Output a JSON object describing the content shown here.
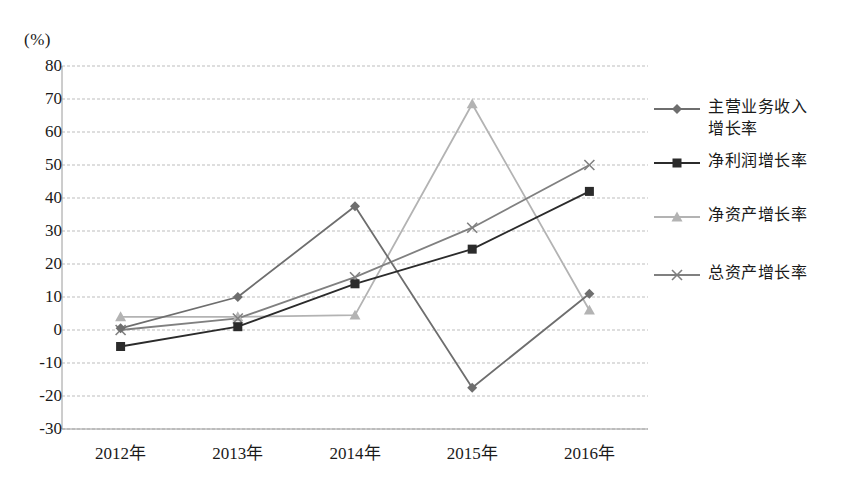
{
  "chart_data": {
    "type": "line",
    "title": "",
    "subtitle": "",
    "xlabel": "",
    "ylabel": "(%)",
    "unit_label": "(%)",
    "categories": [
      "2012年",
      "2013年",
      "2014年",
      "2015年",
      "2016年"
    ],
    "ylim": [
      -30,
      80
    ],
    "ytick_step": 10,
    "yticks": [
      "80",
      "70",
      "60",
      "50",
      "40",
      "30",
      "20",
      "10",
      "0",
      "-10",
      "-20",
      "-30"
    ],
    "ytick_values": [
      80,
      70,
      60,
      50,
      40,
      30,
      20,
      10,
      0,
      -10,
      -20,
      -30
    ],
    "grid": true,
    "grid_style": "dashed-horizontal",
    "legend_position": "right",
    "series": [
      {
        "name": "主营业务收入\n增长率",
        "name_flat": "主营业务收入增长率",
        "marker": "diamond",
        "color": "#6e6e6e",
        "values": [
          0.5,
          10,
          37.5,
          -17.5,
          11
        ]
      },
      {
        "name": "净利润增长率",
        "name_flat": "净利润增长率",
        "marker": "square",
        "color": "#2b2b2b",
        "values": [
          -5,
          1,
          14,
          24.5,
          42
        ]
      },
      {
        "name": "净资产增长率",
        "name_flat": "净资产增长率",
        "marker": "triangle",
        "color": "#b3b3b3",
        "values": [
          4,
          4,
          4.5,
          68.5,
          6
        ]
      },
      {
        "name": "总资产增长率",
        "name_flat": "总资产增长率",
        "marker": "cross",
        "color": "#808080",
        "values": [
          0,
          3.5,
          16,
          31,
          50
        ]
      }
    ]
  },
  "colors": {
    "grid": "#bdbdbd",
    "axis": "#9a9a9a",
    "text": "#1a1a1a",
    "background": "#ffffff"
  },
  "legend": {
    "items": [
      {
        "label": "主营业务收入\n增长率",
        "marker": "diamond",
        "color": "#6e6e6e"
      },
      {
        "label": "净利润增长率",
        "marker": "square",
        "color": "#2b2b2b"
      },
      {
        "label": "净资产增长率",
        "marker": "triangle",
        "color": "#b3b3b3"
      },
      {
        "label": "总资产增长率",
        "marker": "cross",
        "color": "#808080"
      }
    ]
  }
}
